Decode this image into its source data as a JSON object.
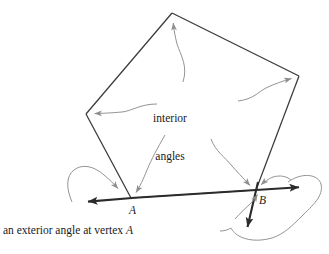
{
  "figure": {
    "kind": "geometry-diagram",
    "background_color": "#ffffff",
    "stroke_color": "#3a3a3a",
    "thick_stroke_color": "#2b2b2b",
    "leader_color": "#8d8d8d",
    "text_color": "#1a1a1a",
    "width": 329,
    "height": 254
  },
  "labels": {
    "interior_line1": "interior",
    "interior_line2": "angles",
    "vertex_a": "A",
    "vertex_b": "B",
    "caption_text": "an exterior angle at vertex ",
    "caption_vertex": "A"
  },
  "geometry": {
    "polygon_vertices": [
      {
        "name": "apex-top",
        "x": 172,
        "y": 13
      },
      {
        "name": "right",
        "x": 299,
        "y": 76
      },
      {
        "name": "vertex-B",
        "x": 256,
        "y": 190
      },
      {
        "name": "vertex-A",
        "x": 131,
        "y": 198
      },
      {
        "name": "left",
        "x": 86,
        "y": 114
      }
    ],
    "exterior_ray_a": {
      "from_x": 131,
      "from_y": 198,
      "to_x": 85,
      "to_y": 202
    },
    "exterior_ray_b_right": {
      "from_x": 256,
      "from_y": 190,
      "to_x": 303,
      "to_y": 187
    },
    "exterior_ray_b_down": {
      "from_x": 256,
      "from_y": 190,
      "to_x": 246,
      "to_y": 231
    }
  },
  "annotations": {
    "leader_apex": "arrow-to-top-apex",
    "leader_right": "arrow-to-right-vertex",
    "leader_left": "arrow-to-left-vertex",
    "leader_vertex_a": "arrow-to-vertex-a",
    "leader_vertex_b": "arrow-to-vertex-b",
    "swoosh_exterior_a": "curved-arrow-exterior-angle-a",
    "swoosh_exterior_b": "curved-loop-exterior-angle-b"
  }
}
